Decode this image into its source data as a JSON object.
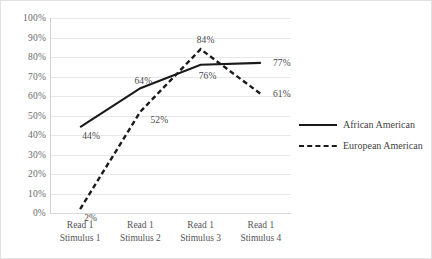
{
  "chart_data": {
    "type": "line",
    "title": "",
    "xlabel": "",
    "ylabel": "",
    "ylim": [
      0,
      100
    ],
    "ytick_labels": [
      "100%",
      "90%",
      "80%",
      "70%",
      "60%",
      "50%",
      "40%",
      "30%",
      "20%",
      "10%",
      "0%"
    ],
    "ytick_values": [
      100,
      90,
      80,
      70,
      60,
      50,
      40,
      30,
      20,
      10,
      0
    ],
    "grid": true,
    "legend_position": "right",
    "categories": [
      {
        "line1": "Read 1",
        "line2": "Stimulus 1"
      },
      {
        "line1": "Read 1",
        "line2": "Stimulus 2"
      },
      {
        "line1": "Read 1",
        "line2": "Stimulus 3"
      },
      {
        "line1": "Read 1",
        "line2": "Stimulus 4"
      }
    ],
    "series": [
      {
        "name": "African American",
        "style": "solid",
        "color": "#1a1a1a",
        "values": [
          44,
          64,
          76,
          77
        ],
        "labels": [
          "44%",
          "64%",
          "76%",
          "77%"
        ]
      },
      {
        "name": "European American",
        "style": "dashed",
        "color": "#1a1a1a",
        "values": [
          2,
          52,
          84,
          61
        ],
        "labels": [
          "2%",
          "52%",
          "84%",
          "61%"
        ]
      }
    ]
  },
  "legend": {
    "items": [
      {
        "label": "African American",
        "style": "solid"
      },
      {
        "label": "European American",
        "style": "dashed"
      }
    ]
  },
  "colors": {
    "gridline": "#e8e8e8",
    "axis": "#d0d0d0",
    "series": "#1a1a1a",
    "tick_text": "#6a6a6a",
    "border": "#e2e2e2"
  }
}
